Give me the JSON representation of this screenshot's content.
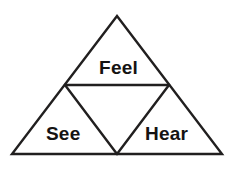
{
  "diagram": {
    "name": "sensory-learning-triangle",
    "background_color": "#ffffff",
    "stroke_color": "#211f1f",
    "text_color": "#141313",
    "stroke_width": 2.4,
    "outer_triangle": {
      "apex": [
        117,
        16
      ],
      "bottom_left": [
        12,
        154
      ],
      "bottom_right": [
        222,
        154
      ]
    },
    "inner_points": {
      "left_midpoint": [
        65,
        85
      ],
      "right_midpoint": [
        169,
        85
      ],
      "bottom_midpoint": [
        117,
        154
      ]
    },
    "segments": [
      {
        "name": "outer-left-edge",
        "from": [
          117,
          16
        ],
        "to": [
          12,
          154
        ]
      },
      {
        "name": "outer-right-edge",
        "from": [
          117,
          16
        ],
        "to": [
          222,
          154
        ]
      },
      {
        "name": "outer-base-edge",
        "from": [
          12,
          154
        ],
        "to": [
          222,
          154
        ]
      },
      {
        "name": "inner-horizontal",
        "from": [
          65,
          85
        ],
        "to": [
          169,
          85
        ]
      },
      {
        "name": "inner-left-diagonal",
        "from": [
          65,
          85
        ],
        "to": [
          117,
          154
        ]
      },
      {
        "name": "inner-right-diagonal",
        "from": [
          169,
          85
        ],
        "to": [
          117,
          154
        ]
      }
    ],
    "labels": {
      "top": "Feel",
      "bottom_left": "See",
      "bottom_right": "Hear"
    }
  }
}
